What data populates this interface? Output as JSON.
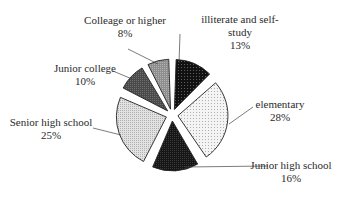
{
  "chart_data": {
    "type": "pie",
    "title": "",
    "categories": [
      "illiterate and self-study",
      "elementary",
      "Junior high school",
      "Senior high school",
      "Junior college",
      "Colleage or higher"
    ],
    "values": [
      13,
      28,
      16,
      25,
      10,
      8
    ],
    "unit": "%",
    "exploded": true,
    "start_angle_deg": 0,
    "direction": "clockwise",
    "slices": [
      {
        "label_line1": "illiterate and self-",
        "label_line2": "study",
        "pct": "13%",
        "value": 13,
        "fill": "#1a1a1a",
        "pattern": "dots-light-on-dark"
      },
      {
        "label_line1": "elementary",
        "label_line2": "",
        "pct": "28%",
        "value": 28,
        "fill": "#f2f2f2",
        "pattern": "sparse-dots"
      },
      {
        "label_line1": "Junior high school",
        "label_line2": "",
        "pct": "16%",
        "value": 16,
        "fill": "#1c1c1c",
        "pattern": "dense-dark"
      },
      {
        "label_line1": "Senior high school",
        "label_line2": "",
        "pct": "25%",
        "value": 25,
        "fill": "#d9d9d9",
        "pattern": "fine-grid"
      },
      {
        "label_line1": "Junior college",
        "label_line2": "",
        "pct": "10%",
        "value": 10,
        "fill": "#555555",
        "pattern": "medium-dark"
      },
      {
        "label_line1": "Colleage or higher",
        "label_line2": "",
        "pct": "8%",
        "value": 8,
        "fill": "#9a9a9a",
        "pattern": "medium-grey"
      }
    ],
    "legend": "none (leader-line labels)"
  }
}
